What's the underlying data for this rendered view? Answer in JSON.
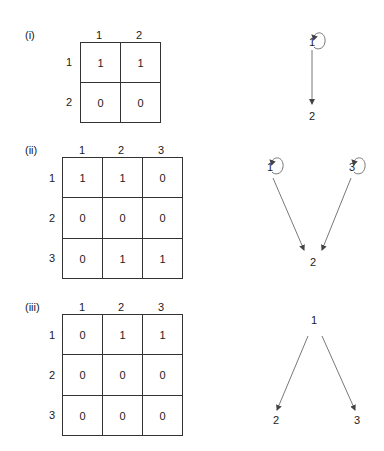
{
  "figures": [
    {
      "label": "(i)",
      "matrix": {
        "col_headers": [
          "1",
          "2"
        ],
        "row_headers": [
          "1",
          "2"
        ],
        "rows": [
          [
            "1",
            "1"
          ],
          [
            "0",
            "0"
          ]
        ]
      },
      "graph": {
        "nodes": [
          "1",
          "2"
        ],
        "edges": [
          [
            "1",
            "1"
          ],
          [
            "1",
            "2"
          ]
        ]
      }
    },
    {
      "label": "(ii)",
      "matrix": {
        "col_headers": [
          "1",
          "2",
          "3"
        ],
        "row_headers": [
          "1",
          "2",
          "3"
        ],
        "rows": [
          [
            "1",
            "1",
            "0"
          ],
          [
            "0",
            "0",
            "0"
          ],
          [
            "0",
            "1",
            "1"
          ]
        ]
      },
      "graph": {
        "nodes": [
          "1",
          "2",
          "3"
        ],
        "edges": [
          [
            "1",
            "1"
          ],
          [
            "1",
            "2"
          ],
          [
            "3",
            "3"
          ],
          [
            "3",
            "2"
          ]
        ]
      }
    },
    {
      "label": "(iii)",
      "matrix": {
        "col_headers": [
          "1",
          "2",
          "3"
        ],
        "row_headers": [
          "1",
          "2",
          "3"
        ],
        "rows": [
          [
            "0",
            "1",
            "1"
          ],
          [
            "0",
            "0",
            "0"
          ],
          [
            "0",
            "0",
            "0"
          ]
        ]
      },
      "graph": {
        "nodes": [
          "1",
          "2",
          "3"
        ],
        "edges": [
          [
            "1",
            "2"
          ],
          [
            "1",
            "3"
          ]
        ]
      }
    }
  ],
  "colors": {
    "line": "#333333",
    "text": "#1a1a1a",
    "arrow": "#555555"
  }
}
